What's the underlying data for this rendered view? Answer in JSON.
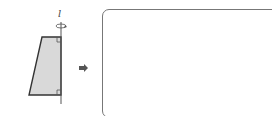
{
  "diagram": {
    "axis_label": "l",
    "shape": "right trapezoid",
    "fill_color": "#d9d9d9",
    "stroke_color": "#333333",
    "transform": "rotate about axis l",
    "arrow": "right-arrow",
    "answer_box": "empty"
  }
}
